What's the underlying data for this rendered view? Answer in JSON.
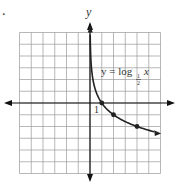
{
  "figure": {
    "marker_label": ".",
    "y_axis_label": "y",
    "equation": {
      "prefix": "y = log",
      "base_numerator": "1",
      "base_denominator": "2",
      "variable": "x"
    },
    "tick_label_x1": "1"
  },
  "colors": {
    "curve": "#222222",
    "grid": "#9a9a9a",
    "axis": "#111111"
  },
  "chart_data": {
    "type": "line",
    "title": "",
    "function": "y = log_{1/2} x",
    "xlabel": "",
    "ylabel": "y",
    "xlim": [
      -6,
      6
    ],
    "ylim": [
      -6,
      6
    ],
    "grid": true,
    "grid_step": 1,
    "tick_labels": [
      {
        "axis": "x",
        "value": 1,
        "label": "1"
      }
    ],
    "series": [
      {
        "name": "y = log_{1/2} x",
        "x": [
          0.03125,
          0.0625,
          0.125,
          0.25,
          0.5,
          1,
          2,
          4,
          5.5
        ],
        "y": [
          5,
          4,
          3,
          2,
          1,
          0,
          -1,
          -2,
          -2.46
        ]
      }
    ],
    "marked_points": [
      {
        "x": 1,
        "y": 0
      },
      {
        "x": 2,
        "y": -1
      },
      {
        "x": 4,
        "y": -2
      }
    ],
    "annotations": [
      {
        "text": "y = log_{1/2} x",
        "x": 1,
        "y": 2.5
      }
    ]
  }
}
